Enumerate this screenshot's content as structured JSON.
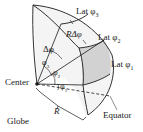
{
  "diagram": {
    "labels": {
      "lat3": "Lat φ",
      "lat3_sub": "3",
      "lat2": "Lat φ",
      "lat2_sub": "2",
      "lat1": "Lat φ",
      "lat1_sub": "1",
      "r_delta_phi": "RΔφ",
      "delta_phi": "Δφ",
      "phi3": "φ",
      "phi3_sub": "3",
      "phi2": "φ",
      "phi2_sub": "2",
      "phi1": "φ",
      "phi1_sub": "1",
      "center": "Center",
      "radius": "R",
      "equator": "Equator",
      "globe": "Globe"
    },
    "colors": {
      "line": "#1a1a1a",
      "shaded_band": "#d2d2d2",
      "surface": "#f2f2f2"
    }
  }
}
